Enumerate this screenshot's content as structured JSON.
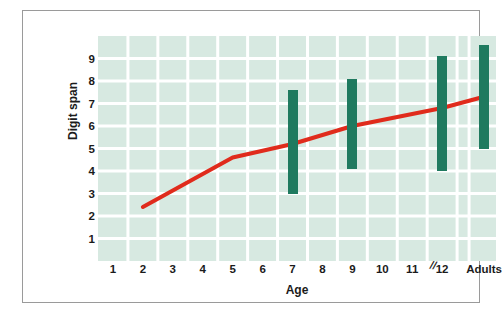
{
  "chart_data": {
    "type": "line",
    "title": "",
    "xlabel": "Age",
    "ylabel": "Digit span",
    "xlim": [
      0.5,
      13.8
    ],
    "ylim": [
      0,
      10
    ],
    "grid": true,
    "legend": null,
    "x_tick_labels": [
      "1",
      "2",
      "3",
      "4",
      "5",
      "6",
      "7",
      "8",
      "9",
      "10",
      "11",
      "12",
      "Adults"
    ],
    "x_tick_positions": [
      1,
      2,
      3,
      4,
      5,
      6,
      7,
      8,
      9,
      10,
      11,
      12,
      13.4
    ],
    "y_tick_labels": [
      "1",
      "2",
      "3",
      "4",
      "5",
      "6",
      "7",
      "8",
      "9"
    ],
    "y_tick_positions": [
      1,
      2,
      3,
      4,
      5,
      6,
      7,
      8,
      9
    ],
    "axis_break": {
      "label": "//",
      "x_position": 12.85
    },
    "series": [
      {
        "name": "Mean digit span",
        "type": "line",
        "color": "#e02b1c",
        "x": [
          2,
          5,
          7,
          9,
          12,
          13.4
        ],
        "values": [
          2.4,
          4.6,
          5.2,
          6.0,
          6.8,
          7.3
        ]
      },
      {
        "name": "Range of digit span",
        "type": "range-bars",
        "color": "#1f7a5f",
        "x": [
          7,
          9,
          12,
          13.4
        ],
        "x_labels": [
          "7",
          "9",
          "12",
          "Adults"
        ],
        "low": [
          3.0,
          4.1,
          4.0,
          5.0
        ],
        "high": [
          7.6,
          8.1,
          9.1,
          9.6
        ]
      }
    ],
    "colors": {
      "plot_background": "#d7e9e1",
      "gridline": "#ffffff",
      "bar": "#1f7a5f",
      "line": "#e02b1c",
      "frame_border": "#9a9a9a",
      "text": "#1b1b1b",
      "page_background": "#ffffff"
    }
  }
}
